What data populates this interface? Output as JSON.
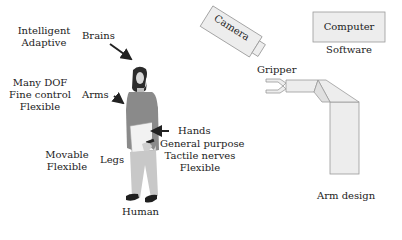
{
  "human": {
    "title": "Human",
    "brains": {
      "label": "Brains",
      "traits": [
        "Intelligent",
        "Adaptive"
      ]
    },
    "arms": {
      "label": "Arms",
      "traits": [
        "Many DOF",
        "Fine control",
        "Flexible"
      ]
    },
    "hands": {
      "label": "Hands",
      "traits": [
        "General purpose",
        "Tactile nerves",
        "Flexible"
      ]
    },
    "legs": {
      "label": "Legs",
      "traits": [
        "Movable",
        "Flexible"
      ]
    }
  },
  "robot": {
    "camera": "Camera",
    "computer": "Computer",
    "software": "Software",
    "gripper": "Gripper",
    "arm_design": "Arm design"
  },
  "colors": {
    "box_fill": "#ededed",
    "box_stroke": "#9a9a9a",
    "shirt": "#8a8a8a",
    "pants": "#c8c8c8",
    "hair": "#2a2a2a",
    "arrow": "#222222"
  }
}
